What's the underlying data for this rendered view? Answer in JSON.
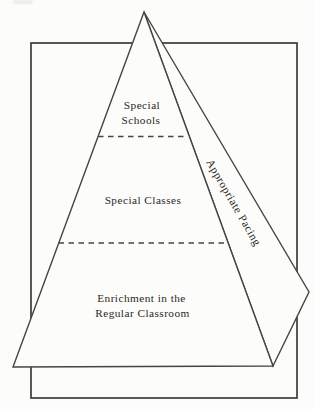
{
  "colors": {
    "background": "#fcfcfa",
    "line": "#474441",
    "frame_line": "#3d3b38",
    "text": "#2c2823"
  },
  "diagram": {
    "type": "pyramid",
    "levels": [
      {
        "label": "Special Schools",
        "lines": [
          "Special",
          "Schools"
        ]
      },
      {
        "label": "Special Classes",
        "lines": [
          "Special Classes"
        ]
      },
      {
        "label": "Enrichment in the Regular Classroom",
        "lines": [
          "Enrichment in the",
          "Regular Classroom"
        ]
      }
    ],
    "side_label": "Appropriate Pacing"
  }
}
